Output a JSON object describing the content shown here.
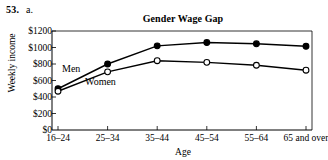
{
  "exercise": {
    "number": "53.",
    "part": "a."
  },
  "chart_data": {
    "type": "line",
    "title": "Gender Wage Gap",
    "xlabel": "Age",
    "ylabel": "Weekly income",
    "categories": [
      "16–24",
      "25–34",
      "35–44",
      "45–54",
      "55–64",
      "65 and over"
    ],
    "series": [
      {
        "name": "Men",
        "marker": "filled-circle",
        "values": [
          500,
          800,
          1020,
          1060,
          1045,
          1015
        ]
      },
      {
        "name": "Women",
        "marker": "open-circle",
        "values": [
          470,
          705,
          840,
          820,
          785,
          725
        ]
      }
    ],
    "ylim": [
      0,
      1200
    ],
    "ytick_values": [
      0,
      200,
      400,
      600,
      800,
      1000,
      1200
    ],
    "ytick_labels": [
      "$0",
      "$200",
      "$400",
      "$600",
      "$800",
      "$1000",
      "$1200"
    ],
    "grid": false,
    "legend": "inline-labels",
    "line_color": "#000000",
    "axis_color": "#000000"
  }
}
